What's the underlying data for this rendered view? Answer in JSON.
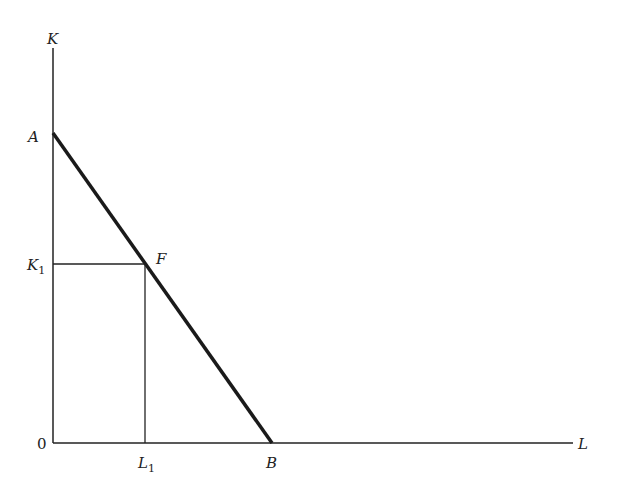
{
  "diagram": {
    "type": "isocost-budget-line",
    "axes": {
      "y_label": "K",
      "x_label": "L",
      "origin_label": "0"
    },
    "points": {
      "A": {
        "label": "A",
        "desc": "y-intercept of budget line"
      },
      "B": {
        "label": "B",
        "desc": "x-intercept of budget line"
      },
      "F": {
        "label": "F",
        "desc": "point on line at (L1, K1)"
      }
    },
    "ticks": {
      "K1": {
        "main": "K",
        "sub": "1"
      },
      "L1": {
        "main": "L",
        "sub": "1"
      }
    },
    "colors": {
      "line": "#1a1a1a",
      "axis": "#222222"
    }
  }
}
